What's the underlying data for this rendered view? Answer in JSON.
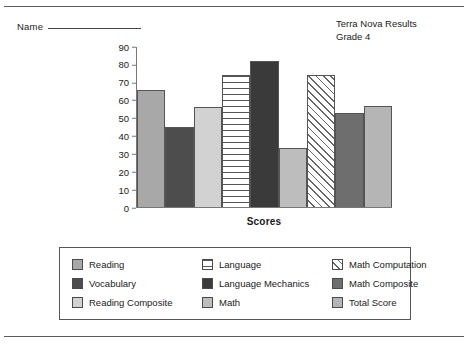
{
  "page": {
    "name_label": "Name",
    "title_line1": "Terra Nova Results",
    "title_line2": "Grade 4"
  },
  "chart_data": {
    "type": "bar",
    "title": "Terra Nova Results Grade 4",
    "xlabel": "Scores",
    "ylabel": "",
    "ylim": [
      0,
      90
    ],
    "yticks": [
      0,
      10,
      20,
      30,
      40,
      50,
      60,
      70,
      80,
      90
    ],
    "grid": false,
    "legend_position": "bottom",
    "categories": [
      "Reading",
      "Vocabulary",
      "Reading Composite",
      "Language",
      "Language Mechanics",
      "Math",
      "Math Computation",
      "Math Composite",
      "Total Score"
    ],
    "values": [
      66,
      45,
      56,
      74,
      82,
      33,
      74,
      53,
      57
    ],
    "styles": [
      {
        "fill": "#a8a8a8",
        "pattern": "solid"
      },
      {
        "fill": "#4d4d4d",
        "pattern": "solid"
      },
      {
        "fill": "#d2d2d2",
        "pattern": "solid"
      },
      {
        "fill": "#ffffff",
        "pattern": "horizontal-lines"
      },
      {
        "fill": "#3a3a3a",
        "pattern": "solid"
      },
      {
        "fill": "#bdbdbd",
        "pattern": "solid"
      },
      {
        "fill": "#ffffff",
        "pattern": "diagonal-hatch"
      },
      {
        "fill": "#6e6e6e",
        "pattern": "solid"
      },
      {
        "fill": "#b5b5b5",
        "pattern": "solid"
      }
    ]
  },
  "legend": {
    "items": [
      {
        "label": "Reading",
        "fill": "#a8a8a8",
        "pattern": "solid"
      },
      {
        "label": "Language",
        "fill": "#ffffff",
        "pattern": "horizontal-lines"
      },
      {
        "label": "Math Computation",
        "fill": "#ffffff",
        "pattern": "diagonal-hatch"
      },
      {
        "label": "Vocabulary",
        "fill": "#4d4d4d",
        "pattern": "solid"
      },
      {
        "label": "Language Mechanics",
        "fill": "#3a3a3a",
        "pattern": "solid"
      },
      {
        "label": "Math Composite",
        "fill": "#6e6e6e",
        "pattern": "solid"
      },
      {
        "label": "Reading Composite",
        "fill": "#d2d2d2",
        "pattern": "solid"
      },
      {
        "label": "Math",
        "fill": "#bdbdbd",
        "pattern": "solid"
      },
      {
        "label": "Total Score",
        "fill": "#b5b5b5",
        "pattern": "solid"
      }
    ]
  }
}
